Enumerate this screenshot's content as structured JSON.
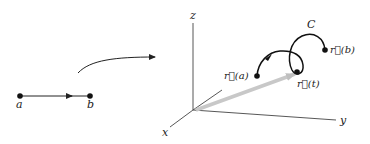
{
  "diagram": {
    "interval": {
      "start_label": "a",
      "end_label": "b"
    },
    "mapping_arrow": "maps-to-arrow",
    "axes": {
      "x_label": "x",
      "y_label": "y",
      "z_label": "z"
    },
    "curve": {
      "label": "C",
      "start_label": "r⃗(a)",
      "point_label": "r⃗(t)",
      "end_label": "r⃗(b)"
    },
    "colors": {
      "ink": "#222222",
      "position_vector": "#c8c8c8"
    }
  }
}
